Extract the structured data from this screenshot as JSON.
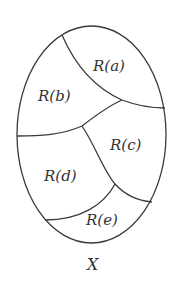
{
  "diagram": {
    "set_label": "X",
    "regions": [
      {
        "id": "a",
        "label": "R(a)"
      },
      {
        "id": "b",
        "label": "R(b)"
      },
      {
        "id": "c",
        "label": "R(c)"
      },
      {
        "id": "d",
        "label": "R(d)"
      },
      {
        "id": "e",
        "label": "R(e)"
      }
    ],
    "colors": {
      "stroke": "#3a3a3a",
      "text": "#333333",
      "background": "#ffffff"
    }
  }
}
